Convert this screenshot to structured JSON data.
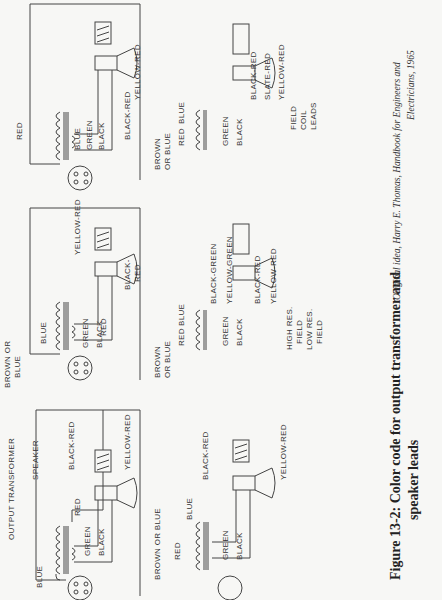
{
  "orientation": "rotated 90deg counter-clockwise",
  "caption": {
    "line1": "Figure 13-2: Color code for output transformer and",
    "line2": "speaker leads"
  },
  "credit": {
    "line1": "Original idea, Harry E. Thomas, Handbook for Engineers and",
    "line2": "Electricians, 1965"
  },
  "diagrams": [
    {
      "id": "top-left",
      "title": "OUTPUT TRANSFORMER",
      "speaker_label": "SPEAKER",
      "primary_labels": [
        "BLUE",
        "RED"
      ],
      "secondary_labels": [
        "GREEN",
        "BLACK"
      ],
      "field_labels": [
        "BLACK-RED",
        "YELLOW-RED"
      ],
      "socket_pins": [
        "1",
        "2",
        "3",
        "4"
      ]
    },
    {
      "id": "top-middle",
      "primary_labels": [
        "BROWN OR",
        "BLUE",
        "BLUE",
        "RED"
      ],
      "secondary_labels": [
        "GREEN",
        "BLACK"
      ],
      "field_labels": [
        "BLACK-",
        "RED",
        "YELLOW-RED"
      ],
      "socket_pins": [
        "1",
        "2",
        "3",
        "4"
      ]
    },
    {
      "id": "top-right",
      "primary_labels": [
        "RED",
        "BLUE"
      ],
      "secondary_labels": [
        "GREEN",
        "BLACK"
      ],
      "field_labels": [
        "BLACK-RED",
        "YELLOW-RED"
      ],
      "socket_pins": [
        "1",
        "2",
        "3",
        "4"
      ]
    },
    {
      "id": "bottom-left",
      "primary_labels": [
        "BROWN OR BLUE",
        "RED",
        "BLUE"
      ],
      "secondary_labels": [
        "GREEN",
        "BLACK"
      ],
      "field_labels": [
        "BLACK-RED",
        "YELLOW-RED"
      ]
    },
    {
      "id": "bottom-middle",
      "primary_labels": [
        "BROWN",
        "OR BLUE",
        "RED",
        "BLUE"
      ],
      "secondary_labels": [
        "GREEN",
        "BLACK"
      ],
      "field_labels": [
        "BLACK-GREEN",
        "YELLOW-GREEN",
        "BLACK-RED",
        "YELLOW-RED"
      ],
      "group_labels": [
        "HIGH RES.",
        "FIELD",
        "LOW RES.",
        "FIELD"
      ]
    },
    {
      "id": "bottom-right",
      "primary_labels": [
        "BROWN",
        "OR BLUE",
        "RED",
        "BLUE"
      ],
      "secondary_labels": [
        "GREEN",
        "BLACK"
      ],
      "field_labels": [
        "BLACK-RED",
        "SLATE-RED",
        "YELLOW-RED"
      ],
      "group_labels": [
        "FIELD",
        "COIL",
        "LEADS"
      ]
    }
  ]
}
